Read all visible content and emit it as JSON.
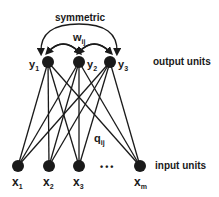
{
  "diagram": {
    "top_label": "symmetric",
    "weight_top": {
      "base": "w",
      "sub": "ij"
    },
    "weight_mid": {
      "base": "q",
      "sub": "ij"
    },
    "output_label": "output units",
    "input_label": "input units",
    "ellipsis": "•••",
    "output_nodes": [
      {
        "base": "y",
        "sub": "1"
      },
      {
        "base": "y",
        "sub": "2"
      },
      {
        "base": "y",
        "sub": "3"
      }
    ],
    "input_nodes": [
      {
        "base": "x",
        "sub": "1"
      },
      {
        "base": "x",
        "sub": "2"
      },
      {
        "base": "x",
        "sub": "3"
      },
      {
        "base": "x",
        "sub": "m"
      }
    ],
    "colors": {
      "ink": "#1a1a1a",
      "background": "#ffffff"
    }
  }
}
